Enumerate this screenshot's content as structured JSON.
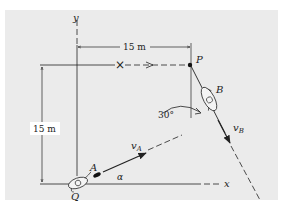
{
  "figure": {
    "labels": {
      "axis_y": "y",
      "axis_x": "x",
      "point_p": "P",
      "point_q": "Q",
      "particle_a": "A",
      "particle_b": "B",
      "velocity_a": "v",
      "velocity_a_sub": "A",
      "velocity_b": "v",
      "velocity_b_sub": "B",
      "angle_alpha": "α",
      "angle_30": "30°",
      "dim_horizontal": "15 m",
      "dim_vertical": "15 m"
    },
    "marker_x": "×",
    "colors": {
      "panel": "#ebebeb",
      "ink": "#222222"
    }
  }
}
